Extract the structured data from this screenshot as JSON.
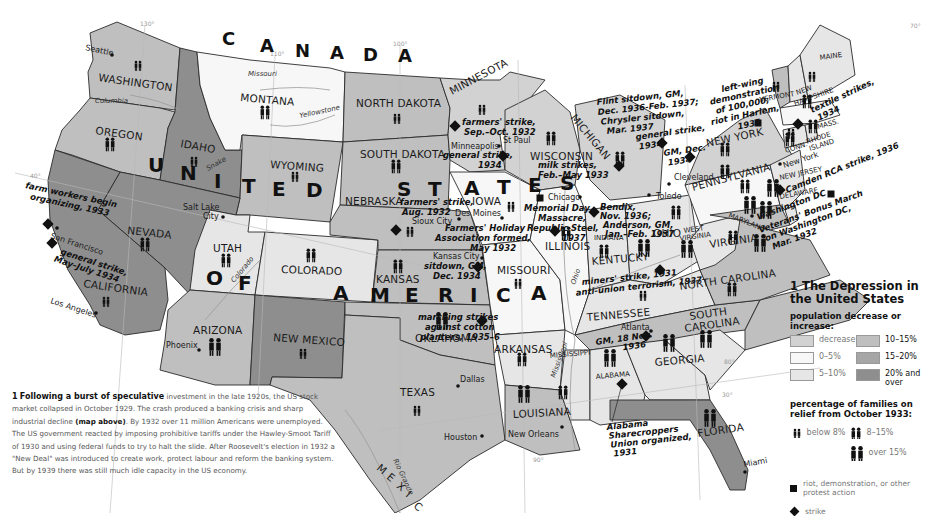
{
  "map": {
    "title_number": "1",
    "title": "The Depression in the United States",
    "country_labels": {
      "canada": [
        "C",
        "A",
        "N",
        "A",
        "D",
        "A"
      ],
      "usa_line1": [
        "U",
        "N",
        "I",
        "T",
        "E",
        "D",
        "S",
        "T",
        "A",
        "T",
        "E",
        "S"
      ],
      "usa_line2": [
        "O",
        "F",
        "A",
        "M",
        "E",
        "R",
        "I",
        "C",
        "A"
      ],
      "mexico": [
        "M",
        "E",
        "X",
        "I",
        "C"
      ]
    },
    "states": {
      "washington": "WASHINGTON",
      "oregon": "OREGON",
      "california": "CALIFORNIA",
      "idaho": "IDAHO",
      "nevada": "NEVADA",
      "montana": "MONTANA",
      "wyoming": "WYOMING",
      "utah": "UTAH",
      "arizona": "ARIZONA",
      "colorado": "COLORADO",
      "new_mexico": "NEW MEXICO",
      "north_dakota": "NORTH DAKOTA",
      "south_dakota": "SOUTH DAKOTA",
      "nebraska": "NEBRASKA",
      "kansas": "KANSAS",
      "oklahoma": "OKLAHOMA",
      "texas": "TEXAS",
      "minnesota": "MINNESOTA",
      "iowa": "IOWA",
      "missouri": "MISSOURI",
      "arkansas": "ARKANSAS",
      "louisiana": "LOUISIANA",
      "wisconsin": "WISCONSIN",
      "illinois": "ILLINOIS",
      "michigan": "MICHIGAN",
      "indiana": "INDIANA",
      "ohio": "OHIO",
      "kentucky": "KENTUCKY",
      "tennessee": "TENNESSEE",
      "mississippi": "MISSISSIPPI",
      "alabama": "ALABAMA",
      "georgia": "GEORGIA",
      "florida": "FLORIDA",
      "south_carolina_1": "SOUTH",
      "south_carolina_2": "CAROLINA",
      "north_carolina": "NORTH CAROLINA",
      "virginia": "VIRGINIA",
      "west_virginia_1": "WEST",
      "west_virginia_2": "VIRGINIA",
      "pennsylvania": "PENNSYLVANIA",
      "new_york": "NEW YORK",
      "maryland": "MARYLAND",
      "delaware": "DELAWARE",
      "new_jersey": "NEW JERSEY",
      "connecticut": "CONN.",
      "rhode_island_1": "RHODE",
      "rhode_island_2": "ISLAND",
      "massachusetts": "MASS.",
      "vermont": "VERMONT",
      "new_hampshire_1": "NEW",
      "new_hampshire_2": "HAMPSHIRE",
      "maine": "MAINE"
    },
    "cities": {
      "seattle": "Seattle",
      "salt_lake_1": "Salt Lake",
      "salt_lake_2": "City",
      "san_francisco": "San Francisco",
      "los_angeles": "Los Angeles",
      "phoenix": "Phoenix",
      "minneapolis": "Minneapolis",
      "st_paul": "St Paul",
      "des_moines": "Des Moines",
      "sioux_city": "Sioux City",
      "kansas_city": "Kansas City",
      "chicago": "Chicago",
      "toledo": "Toledo",
      "cleveland": "Cleveland",
      "dallas": "Dallas",
      "houston": "Houston",
      "new_orleans": "New Orleans",
      "atlanta": "Atlanta",
      "miami": "Miami",
      "new_york": "New York",
      "washington_dc": "Washington DC"
    },
    "rivers": {
      "missouri": "Missouri",
      "yellowstone": "Yellowstone",
      "columbia": "Columbia",
      "snake": "Snake",
      "colorado": "Colorado",
      "rio_grande": "Rio Grande",
      "mississippi": "Mississippi",
      "ohio": "Ohio"
    },
    "longitudes": [
      "130°",
      "110°",
      "100°",
      "90°",
      "80°",
      "70°"
    ],
    "latitudes": [
      "40°",
      "30°"
    ],
    "events": {
      "farm_workers": [
        "farm workers begin",
        "organizing, 1933"
      ],
      "sf_strike": [
        "general strike,",
        "May–July 1934"
      ],
      "mn_farmers": [
        "farmers' strike,",
        "Sep.–Oct. 1932"
      ],
      "mpls_strike": [
        "general strike,",
        "1934"
      ],
      "ne_farmers": [
        "farmers' strike,",
        "Aug. 1932"
      ],
      "farmers_holiday": [
        "Farmers' Holiday",
        "Association formed,",
        "May 1932"
      ],
      "kc_sitdown": [
        "sitdown, GM,",
        "Dec. 1934"
      ],
      "wi_milk": [
        "milk strikes,",
        "Feb.–May 1933"
      ],
      "memorial_day": [
        "Memorial Day",
        "Massacre,",
        "Republic Steel,",
        "1937"
      ],
      "flint": [
        "Flint sitdown, GM,",
        "Dec. 1936-Feb. 1937;",
        "Chrysler sitdown,",
        "Mar. 1937"
      ],
      "toledo_strike": [
        "general strike,",
        "1934"
      ],
      "cleveland_gm": [
        "GM, Dec.",
        "1934"
      ],
      "harlem": [
        "left-wing",
        "demonstration",
        "of 100,000;",
        "riot in Harlem,",
        "1935"
      ],
      "textile": [
        "textile strikes,",
        "1934"
      ],
      "camden": [
        "Camden RCA strike, 1936"
      ],
      "bonus_march": [
        "Veterans' Bonus March",
        "on Washington DC,",
        "Mar. 1932"
      ],
      "bendix": [
        "Bendix,",
        "Nov. 1936;",
        "Anderson, GM,",
        "Jan.–Feb. 1937"
      ],
      "kentucky": [
        "miners' strike, 1931",
        "anti-union terrorism, 1937"
      ],
      "cotton": [
        "marching strikes",
        "against cotton",
        "planters, 1935–6"
      ],
      "atlanta_gm": [
        "GM, 18 Nov.",
        "1936"
      ],
      "sharecroppers": [
        "Alabama",
        "Sharecroppers",
        "Union organized,",
        "1931"
      ]
    }
  },
  "legend": {
    "number": "1",
    "title": "The Depression in the United States",
    "population_heading": "population decrease or increase:",
    "population_bins": [
      {
        "label": "decrease",
        "color": "#d2d2d2"
      },
      {
        "label": "10–15%",
        "color": "#bfbfbf"
      },
      {
        "label": "0–5%",
        "color": "#f7f7f7"
      },
      {
        "label": "15–20%",
        "color": "#a6a6a6"
      },
      {
        "label": "5–10%",
        "color": "#e6e6e6"
      },
      {
        "label": "20% and over",
        "color": "#8e8e8e"
      }
    ],
    "relief_heading": "percentage of families on relief from October 1933:",
    "relief_bins": [
      "below 8%",
      "8–15%",
      "over 15%"
    ],
    "riot_label": "riot, demonstration, or other protest action",
    "strike_label": "strike"
  },
  "caption": {
    "number": "1",
    "lead": "Following a burst of speculative",
    "part1": " investment in the late 1920s, the US stock market collapsed in October 1929. The crash produced a banking crisis and sharp industrial decline ",
    "map_ref": "(map above)",
    "part2": ". By 1932 over 11 million Americans were unemployed. The US government reacted by imposing prohibitive tariffs under the Hawley-Smoot Tariff of 1930 and using federal funds to try to halt the slide. After Roosevelt's election in 1932 a \"New Deal\" was introduced to create work, protect labour and reform the banking system. But by 1939 there was still much idle capacity in the US economy."
  }
}
